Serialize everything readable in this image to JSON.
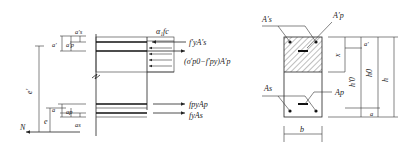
{
  "diagram": {
    "left": {
      "force_labels": {
        "concrete": "α₁fc",
        "comp_steel": "f′yA′s",
        "prestress_comp": "(σ′p0−f′py)A′p",
        "prestress_tens": "fpyAp",
        "tens_steel": "fyAs"
      },
      "dim_labels": {
        "e_prime": "e′",
        "e": "e",
        "a_prime": "a′",
        "a_prime_s": "a′s",
        "a_prime_p": "a′p",
        "a": "a",
        "a_s": "as",
        "a_p": "ap",
        "N": "N"
      }
    },
    "right": {
      "labels": {
        "A_prime_s": "A′s",
        "A_prime_p": "A′p",
        "A_s": "As",
        "A_p": "Ap",
        "x": "x",
        "h0_prime": "h′0",
        "h0": "h0",
        "h": "h",
        "a_prime": "a′",
        "a": "a",
        "b": "b"
      }
    }
  }
}
